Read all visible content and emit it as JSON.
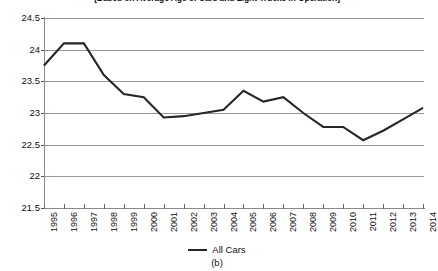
{
  "figure": {
    "title": "[Based on Average Age of Cars and Light Trucks in Operation]",
    "caption": "(b)"
  },
  "legend": {
    "position": "bottom-center",
    "swatch_color": "#262626",
    "entries": [
      {
        "label": "All Cars"
      }
    ]
  },
  "chart_data": {
    "type": "line",
    "title": "[Based on Average Age of Cars and Light Trucks in Operation]",
    "xlabel": "",
    "ylabel": "",
    "ylim": [
      21.5,
      24.5
    ],
    "ytick_interval": 0.5,
    "yticks": [
      "24.5",
      "24",
      "23.5",
      "23",
      "22.5",
      "22",
      "21.5"
    ],
    "grid": true,
    "grid_axis": "y",
    "categories": [
      "1995",
      "1996",
      "1997",
      "1998",
      "1999",
      "2000",
      "2001",
      "2002",
      "2003",
      "2004",
      "2005",
      "2006",
      "2007",
      "2008",
      "2009",
      "2010",
      "2011",
      "2012",
      "2013",
      "2014"
    ],
    "series": [
      {
        "name": "All Cars",
        "color": "#262626",
        "values": [
          23.75,
          24.1,
          24.1,
          23.6,
          23.3,
          23.25,
          22.93,
          22.95,
          23.0,
          23.05,
          23.35,
          23.18,
          23.25,
          23.0,
          22.78,
          22.78,
          22.57,
          22.72,
          22.9,
          23.08
        ]
      }
    ]
  }
}
